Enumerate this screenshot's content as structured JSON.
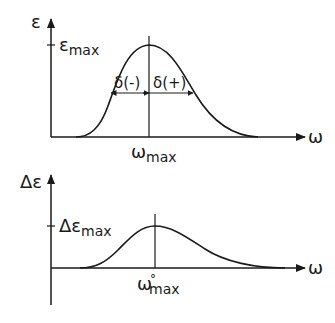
{
  "top_plot": {
    "y_axis_label": "ε",
    "x_axis_label": "ω",
    "peak_label_main": "ε",
    "peak_label_sub": "max",
    "peak_position_label_main": "ω",
    "peak_position_label_sub": "max",
    "left_halfwidth_label": "δ(-)",
    "right_halfwidth_label": "δ(+)"
  },
  "bottom_plot": {
    "y_axis_label": "Δε",
    "x_axis_label": "ω",
    "peak_label_main": "Δε",
    "peak_label_sub": "max",
    "peak_position_label_main": "ω",
    "peak_position_label_sup": "°",
    "peak_position_label_sub": "max"
  },
  "colors": {
    "ink": "#1a1a1a",
    "background": "#ffffff"
  }
}
